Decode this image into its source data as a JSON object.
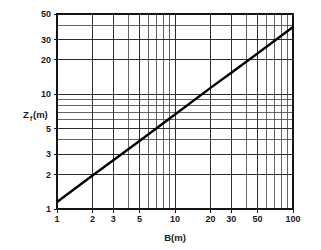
{
  "chart_data": {
    "type": "line",
    "title": "",
    "subtitle": "",
    "xlabel": "B(m)",
    "ylabel": "Z",
    "ylabel_sub": "f",
    "ylabel_unit": "(m)",
    "ylabel_full": "Zf(m)",
    "xscale": "log",
    "yscale": "log",
    "xlim": [
      1,
      100
    ],
    "ylim": [
      1,
      50
    ],
    "grid": true,
    "grid_style": "log-log minor and major gridlines",
    "legend": "none",
    "x_tick_labels": [
      "1",
      "2",
      "3",
      "5",
      "10",
      "20",
      "30",
      "50",
      "100"
    ],
    "x_tick_values": [
      1,
      2,
      3,
      5,
      10,
      20,
      30,
      50,
      100
    ],
    "y_tick_labels": [
      "1",
      "2",
      "3",
      "5",
      "10",
      "20",
      "30",
      "50"
    ],
    "y_tick_values": [
      1,
      2,
      3,
      5,
      10,
      20,
      30,
      50
    ],
    "x_minor_ticks": [
      1,
      2,
      3,
      4,
      5,
      6,
      7,
      8,
      9,
      10,
      20,
      30,
      40,
      50,
      60,
      70,
      80,
      90,
      100
    ],
    "y_minor_ticks": [
      1,
      2,
      3,
      4,
      5,
      6,
      7,
      8,
      9,
      10,
      20,
      30,
      40,
      50
    ],
    "series": [
      {
        "name": "Zf vs B",
        "x": [
          1,
          2,
          3,
          5,
          10,
          20,
          30,
          50,
          100
        ],
        "values": [
          1.15,
          1.96,
          2.66,
          3.91,
          6.66,
          11.35,
          15.4,
          22.6,
          38.5
        ],
        "relation": "Zf = 1.15 * B^0.77",
        "line_color": "#000000",
        "line_width": 2.4
      }
    ],
    "annotations": []
  },
  "figure": {
    "background_color": "#ffffff",
    "frame_color": "#141414",
    "grid_major_color": "#2e2e2e",
    "grid_minor_color": "#4a4a4a"
  }
}
